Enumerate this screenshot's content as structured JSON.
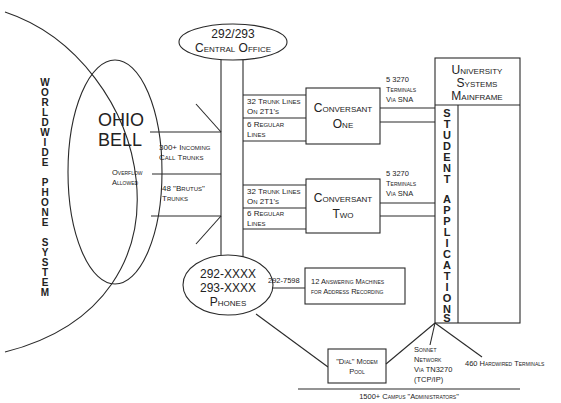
{
  "diagram": {
    "world": {
      "label": "WORLDWIDE PHONE SYSTEM",
      "letters": [
        "W",
        "O",
        "R",
        "L",
        "D",
        "W",
        "I",
        "D",
        "E",
        "",
        "P",
        "H",
        "O",
        "N",
        "E",
        "",
        "S",
        "Y",
        "S",
        "T",
        "E",
        "M"
      ]
    },
    "ohio_bell": {
      "line1": "OHIO",
      "line2": "BELL",
      "overflow1": "Overflow",
      "overflow2": "Allowed"
    },
    "central_office": {
      "line1": "292/293",
      "line2": "Central Office"
    },
    "trunks": {
      "incoming1": "300+ Incoming",
      "incoming2": "Call Trunks",
      "brutus1": "48 \"Brutus\"",
      "brutus2": "Trunks"
    },
    "conversant_one": {
      "line1": "Conversant",
      "line2": "One",
      "trunk1": "32 Trunk Lines",
      "trunk2": "On 2T1's",
      "reg1": "6 Regular",
      "reg2": "Lines",
      "term1": "5 3270",
      "term2": "Terminals",
      "term3": "Via SNA"
    },
    "conversant_two": {
      "line1": "Conversant",
      "line2": "Two",
      "trunk1": "32 Trunk Lines",
      "trunk2": "On 2T1's",
      "reg1": "6 Regular",
      "reg2": "Lines",
      "term1": "5 3270",
      "term2": "Terminals",
      "term3": "Via SNA"
    },
    "mainframe": {
      "line1": "University",
      "line2": "Systems",
      "line3": "Mainframe"
    },
    "student_apps": {
      "label": "STUDENT APPLICATIONS",
      "letters": [
        "S",
        "T",
        "U",
        "D",
        "E",
        "N",
        "T",
        "",
        "A",
        "P",
        "P",
        "L",
        "I",
        "C",
        "A",
        "T",
        "I",
        "O",
        "N",
        "S"
      ]
    },
    "phones": {
      "line1": "292-XXXX",
      "line2": "293-XXXX",
      "line3": "Phones",
      "number": "292-7598"
    },
    "answering": {
      "line1": "12 Answering Machines",
      "line2": "for Address Recording"
    },
    "modem_pool": {
      "line1": "\"Dial\" Modem",
      "line2": "Pool"
    },
    "sonnet": {
      "line1": "Sonnet",
      "line2": "Network",
      "line3": "Via TN3270",
      "line4": "(TCP/IP)"
    },
    "hardwired": {
      "label": "460 Hardwired Terminals"
    },
    "campus": {
      "label": "1500+ Campus \"Administrators\""
    }
  }
}
